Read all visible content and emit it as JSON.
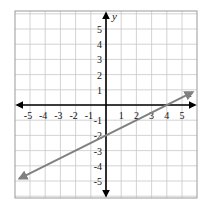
{
  "chart_data": {
    "type": "line",
    "title": "",
    "xlabel": "x",
    "ylabel": "y",
    "xlim": [
      -6,
      6
    ],
    "ylim": [
      -6,
      6
    ],
    "grid": true,
    "x_ticks": [
      "-5",
      "-4",
      "-3",
      "-2",
      "-1",
      "1",
      "2",
      "3",
      "4",
      "5"
    ],
    "y_ticks": [
      "5",
      "4",
      "3",
      "2",
      "1",
      "-1",
      "-2",
      "-3",
      "-4",
      "-5"
    ],
    "series": [
      {
        "name": "line",
        "equation": "y = 0.5x - 2",
        "x": [
          -5.7,
          5.7
        ],
        "y": [
          -4.85,
          0.85
        ],
        "points_on_line": [
          [
            0,
            -2
          ],
          [
            4,
            0
          ]
        ],
        "arrows_both_ends": true,
        "color": "#808080"
      }
    ],
    "legend": null
  },
  "colors": {
    "grid": "#c8c8c8",
    "axis": "#000000",
    "line": "#808080",
    "frame": "#9a9a9a"
  }
}
